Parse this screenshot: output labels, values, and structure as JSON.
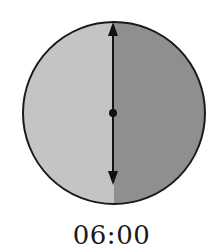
{
  "diagram": {
    "time_label": "06:00",
    "colors": {
      "left_half": "#c4c4c4",
      "right_half": "#8f8f8f",
      "outline": "#1a1a1a",
      "hand": "#111111"
    },
    "hand": {
      "orientation": "vertical",
      "arrows": [
        "up",
        "down"
      ],
      "center_dot": true
    }
  }
}
